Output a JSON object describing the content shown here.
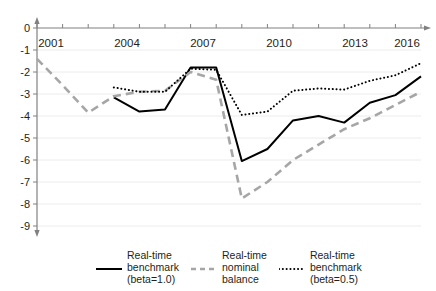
{
  "chart_data": {
    "type": "line",
    "title": "",
    "subtitle": "",
    "xlabel": "",
    "ylabel": "",
    "x": [
      2001,
      2002,
      2003,
      2004,
      2005,
      2006,
      2007,
      2008,
      2009,
      2010,
      2011,
      2012,
      2013,
      2014,
      2015,
      2016
    ],
    "xlim": [
      2001,
      2016
    ],
    "ylim": [
      -9,
      0
    ],
    "xticks": [
      2001,
      2002,
      2003,
      2004,
      2005,
      2006,
      2007,
      2008,
      2009,
      2010,
      2011,
      2012,
      2013,
      2014,
      2015,
      2016
    ],
    "xtick_labels": [
      "2001",
      "",
      "",
      "2004",
      "",
      "",
      "2007",
      "",
      "",
      "2010",
      "",
      "",
      "2013",
      "",
      "",
      "2016"
    ],
    "yticks": [
      0,
      -1,
      -2,
      -3,
      -4,
      -5,
      -6,
      -7,
      -8,
      -9
    ],
    "ytick_labels": [
      "0",
      "-1",
      "-2",
      "-3",
      "-4",
      "-5",
      "-6",
      "-7",
      "-8",
      "-9"
    ],
    "grid": true,
    "grid_color": "#ececec",
    "axis_color": "#808080",
    "axis_position": "x-axis at top, y-axis at left",
    "legend_position": "bottom",
    "series": [
      {
        "name": "Real-time benchmark (beta=1.0)",
        "legend_label": "Real-time\nbenchmark\n(beta=1.0)",
        "style": "solid",
        "color": "#000000",
        "width": 2.0,
        "x": [
          2004,
          2005,
          2006,
          2007,
          2008,
          2009,
          2010,
          2011,
          2012,
          2013,
          2014,
          2015,
          2016
        ],
        "values": [
          -3.15,
          -3.8,
          -3.7,
          -1.8,
          -1.8,
          -6.05,
          -5.5,
          -4.2,
          -4.0,
          -4.3,
          -3.4,
          -3.05,
          -2.2
        ]
      },
      {
        "name": "Real-time nominal balance",
        "legend_label": "Real-time\nnominal\nbalance",
        "style": "dashed",
        "color": "#a6a6a6",
        "width": 2.6,
        "x": [
          2001,
          2002,
          2003,
          2004,
          2005,
          2006,
          2007,
          2008,
          2009,
          2010,
          2011,
          2012,
          2013,
          2014,
          2015,
          2016
        ],
        "values": [
          -1.4,
          -2.6,
          -3.85,
          -3.1,
          -2.9,
          -2.85,
          -2.0,
          -2.35,
          -7.75,
          -7.0,
          -6.0,
          -5.3,
          -4.6,
          -4.1,
          -3.5,
          -2.9
        ]
      },
      {
        "name": "Real-time benchmark (beta=0.5)",
        "legend_label": "Real-time\nbenchmark\n(beta=0.5)",
        "style": "dotted",
        "color": "#000000",
        "width": 2.0,
        "x": [
          2004,
          2005,
          2006,
          2007,
          2008,
          2009,
          2010,
          2011,
          2012,
          2013,
          2014,
          2015,
          2016
        ],
        "values": [
          -2.7,
          -2.9,
          -2.9,
          -1.85,
          -1.9,
          -3.95,
          -3.8,
          -2.85,
          -2.75,
          -2.8,
          -2.4,
          -2.15,
          -1.6
        ]
      }
    ]
  },
  "axis": {
    "y_labels": [
      "0",
      "-1",
      "-2",
      "-3",
      "-4",
      "-5",
      "-6",
      "-7",
      "-8",
      "-9"
    ],
    "x_labels": [
      "2001",
      "2004",
      "2007",
      "2010",
      "2013",
      "2016"
    ]
  },
  "legend": {
    "entries": [
      {
        "label": "Real-time\nbenchmark\n(beta=1.0)",
        "style": "solid"
      },
      {
        "label": "Real-time\nnominal\nbalance",
        "style": "dashed"
      },
      {
        "label": "Real-time\nbenchmark\n(beta=0.5)",
        "style": "dotted"
      }
    ]
  }
}
